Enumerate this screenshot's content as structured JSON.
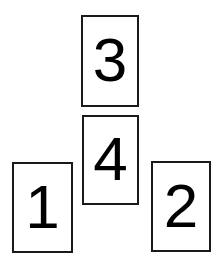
{
  "scene": {
    "title": "Numbered Card Arrangement",
    "background_color": "#ffffff",
    "border_color": "#1a1a1a",
    "text_color": "#000000",
    "canvas": {
      "width": 221,
      "height": 267
    }
  },
  "cards": [
    {
      "id": "card-3",
      "label": "3",
      "position": "top-center",
      "x": 81,
      "y": 15,
      "width": 58,
      "height": 92
    },
    {
      "id": "card-4",
      "label": "4",
      "position": "middle-center",
      "x": 82,
      "y": 115,
      "width": 57,
      "height": 90
    },
    {
      "id": "card-1",
      "label": "1",
      "position": "bottom-left",
      "x": 12,
      "y": 162,
      "width": 61,
      "height": 91
    },
    {
      "id": "card-2",
      "label": "2",
      "position": "bottom-right",
      "x": 151,
      "y": 161,
      "width": 60,
      "height": 91
    }
  ]
}
